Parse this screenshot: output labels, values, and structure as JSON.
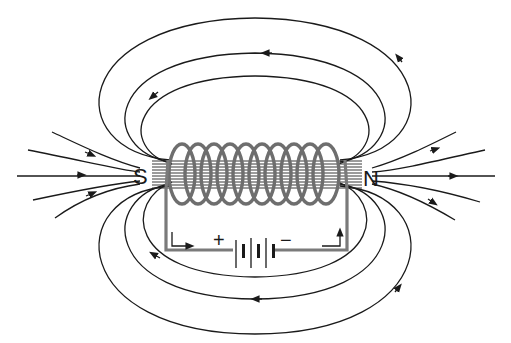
{
  "diagram": {
    "poles": {
      "south": "S",
      "north": "N"
    },
    "battery": {
      "positive": "+",
      "negative": "−"
    },
    "coil_turns": 10,
    "colors": {
      "field_lines": "#1a1a1a",
      "coil": "#6e6e6e",
      "background": "#ffffff"
    }
  }
}
